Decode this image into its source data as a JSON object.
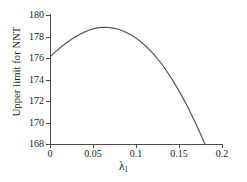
{
  "chart_data": {
    "type": "line",
    "title": "",
    "xlabel": "λ₁",
    "xlabel_base": "λ",
    "xlabel_sub": "1",
    "ylabel": "Upper limit for NNT",
    "xlim": [
      0,
      0.2
    ],
    "ylim": [
      168,
      180
    ],
    "xticks": [
      0,
      0.05,
      0.1,
      0.15,
      0.2
    ],
    "xtick_labels": [
      "0",
      "0.05",
      "0.1",
      "0.15",
      "0.2"
    ],
    "yticks": [
      168,
      170,
      172,
      174,
      176,
      178,
      180
    ],
    "ytick_labels": [
      "168",
      "170",
      "172",
      "174",
      "176",
      "178",
      "180"
    ],
    "grid": false,
    "legend": false,
    "series": [
      {
        "name": "Upper limit for NNT",
        "color": "#555555",
        "linewidth": 1.2,
        "x": [
          0,
          0.005,
          0.01,
          0.015,
          0.02,
          0.025,
          0.03,
          0.035,
          0.04,
          0.045,
          0.05,
          0.055,
          0.06,
          0.065,
          0.07,
          0.075,
          0.08,
          0.085,
          0.09,
          0.095,
          0.1,
          0.105,
          0.11,
          0.115,
          0.12,
          0.125,
          0.13,
          0.135,
          0.14,
          0.145,
          0.15,
          0.155,
          0.16,
          0.165,
          0.17,
          0.175,
          0.18,
          0.185,
          0.19,
          0.195,
          0.2
        ],
        "y": [
          176.1,
          176.48,
          176.83,
          177.16,
          177.46,
          177.74,
          177.99,
          178.21,
          178.41,
          178.58,
          178.71,
          178.8,
          178.85,
          178.86,
          178.83,
          178.76,
          178.65,
          178.51,
          178.33,
          178.11,
          177.85,
          177.55,
          177.21,
          176.83,
          176.4,
          175.93,
          175.42,
          174.86,
          174.26,
          173.62,
          172.94,
          172.22,
          171.46,
          170.66,
          169.82,
          168.94,
          168.02,
          167.06,
          166.06,
          165.02,
          163.94
        ]
      }
    ],
    "annotations": {
      "peak_x": 0.065,
      "peak_y": 178.86,
      "start_y": 176.1,
      "end_visible_y": 168.8
    },
    "colors": {
      "axis": "#4d4d4d",
      "text": "#1a1a1a",
      "curve": "#555555",
      "background": "#ffffff"
    }
  }
}
